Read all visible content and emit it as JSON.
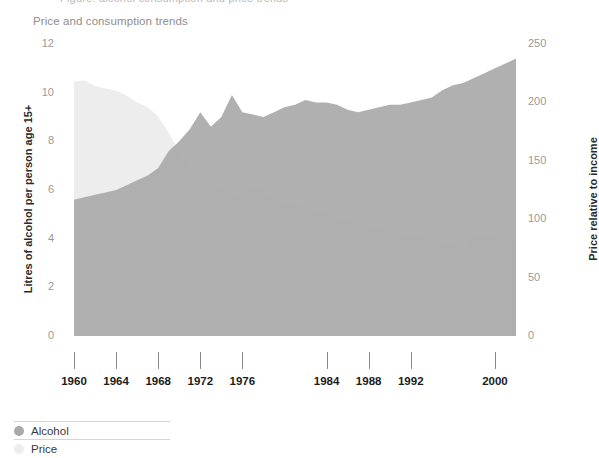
{
  "page": {
    "clipped_top_text": "Figure: alcohol consumption and price trends",
    "background": "#ffffff"
  },
  "chart_data": {
    "type": "area",
    "title": "Price and consumption trends",
    "xlabel": "",
    "ylabel": "Litres of alcohol per person age 15+",
    "y2label": "Price relative to income",
    "grid": false,
    "legend_position": "bottom-left",
    "xlim": [
      1960,
      2002
    ],
    "ylim": [
      0,
      12
    ],
    "y2lim": [
      0,
      250
    ],
    "xticks": [
      1960,
      1964,
      1968,
      1972,
      1976,
      1984,
      1988,
      1992,
      2000
    ],
    "xticklabels": [
      "1960",
      "1964",
      "1968",
      "1972",
      "1976",
      "1984",
      "1988",
      "1992",
      "2000"
    ],
    "yticks": [
      0,
      2,
      4,
      6,
      8,
      10,
      12
    ],
    "yticklabels": [
      "0",
      "2",
      "4",
      "6",
      "8",
      "10",
      "12"
    ],
    "y2ticks": [
      0,
      50,
      100,
      150,
      200,
      250
    ],
    "y2ticklabels": [
      "0",
      "50",
      "100",
      "150",
      "200",
      "250"
    ],
    "colors": {
      "alcohol": "#a9a9a9",
      "price": "#ededed",
      "overlap": "#b6b6b6",
      "tick_label": "#9a9a9a",
      "axis_title": "#2b2b2b",
      "title": "#8e8e8e",
      "tick_mark": "#8a8a8a",
      "legend_rule": "#d5d5d5"
    },
    "x": [
      1960,
      1961,
      1962,
      1963,
      1964,
      1965,
      1966,
      1967,
      1968,
      1969,
      1970,
      1971,
      1972,
      1973,
      1974,
      1975,
      1976,
      1977,
      1978,
      1979,
      1980,
      1981,
      1982,
      1983,
      1984,
      1985,
      1986,
      1987,
      1988,
      1989,
      1990,
      1991,
      1992,
      1993,
      1994,
      1995,
      1996,
      1997,
      1998,
      1999,
      2000,
      2001,
      2002
    ],
    "series": [
      {
        "name": "Alcohol",
        "axis": "left",
        "units": "Litres of alcohol per person age 15+",
        "values": [
          5.6,
          5.7,
          5.8,
          5.9,
          6.0,
          6.2,
          6.4,
          6.6,
          6.9,
          7.6,
          8.0,
          8.5,
          9.2,
          8.6,
          9.0,
          9.9,
          9.2,
          9.1,
          9.0,
          9.2,
          9.4,
          9.5,
          9.7,
          9.6,
          9.6,
          9.5,
          9.3,
          9.2,
          9.3,
          9.4,
          9.5,
          9.5,
          9.6,
          9.7,
          9.8,
          10.1,
          10.3,
          10.4,
          10.6,
          10.8,
          11.0,
          11.2,
          11.4
        ]
      },
      {
        "name": "Price",
        "axis": "right",
        "units": "Price relative to income",
        "values": [
          218,
          219,
          214,
          212,
          210,
          206,
          200,
          196,
          188,
          174,
          158,
          142,
          132,
          130,
          126,
          120,
          124,
          127,
          124,
          118,
          112,
          112,
          110,
          107,
          104,
          100,
          98,
          96,
          94,
          92,
          90,
          88,
          86,
          84,
          82,
          80,
          78,
          76,
          88,
          86,
          84,
          83,
          82
        ]
      }
    ]
  },
  "legend": {
    "items": [
      {
        "label": "Alcohol",
        "color": "#a9a9a9"
      },
      {
        "label": "Price",
        "color": "#ededed"
      }
    ]
  }
}
